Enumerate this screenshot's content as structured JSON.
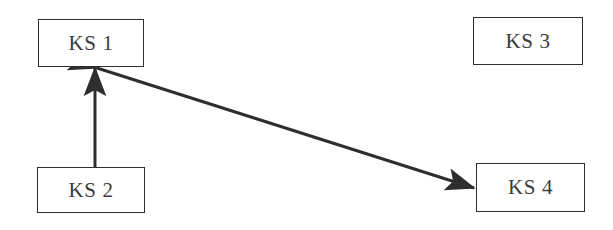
{
  "diagram": {
    "background_color": "#ffffff",
    "stroke_color": "#2e2e2e",
    "text_color": "#3b3b3b",
    "width": 613,
    "height": 230,
    "nodes": [
      {
        "id": "ks1",
        "label": "KS 1",
        "x": 38,
        "y": 19,
        "width": 106,
        "height": 48
      },
      {
        "id": "ks3",
        "label": "KS 3",
        "x": 473,
        "y": 17,
        "width": 110,
        "height": 48
      },
      {
        "id": "ks2",
        "label": "KS 2",
        "x": 37,
        "y": 167,
        "width": 108,
        "height": 46
      },
      {
        "id": "ks4",
        "label": "KS 4",
        "x": 476,
        "y": 163,
        "width": 109,
        "height": 49
      }
    ],
    "edges": [
      {
        "id": "edge-ks2-to-ks1",
        "from": "ks2",
        "to": "ks1",
        "x1": 95,
        "y1": 167,
        "x2": 95,
        "y2": 68,
        "arrow_start": false,
        "arrow_end": true,
        "stroke_width": 3
      },
      {
        "id": "edge-ks1-ks4-bidirectional",
        "from": "ks1",
        "to": "ks4",
        "x1": 97,
        "y1": 68,
        "x2": 474,
        "y2": 188,
        "arrow_start": true,
        "arrow_end": true,
        "stroke_width": 3
      }
    ]
  }
}
